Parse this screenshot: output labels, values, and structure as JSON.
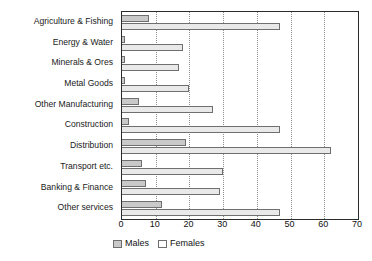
{
  "chart_data": {
    "type": "bar",
    "orientation": "horizontal",
    "title": "",
    "xlabel": "",
    "ylabel": "",
    "xlim": [
      0,
      70
    ],
    "xticks": [
      0,
      10,
      20,
      30,
      40,
      50,
      60,
      70
    ],
    "grid": true,
    "grid_axis": "x",
    "legend_position": "bottom",
    "categories": [
      "Agriculture & Fishing",
      "Energy & Water",
      "Minerals & Ores",
      "Metal Goods",
      "Other Manufacturing",
      "Construction",
      "Distribution",
      "Transport etc.",
      "Banking & Finance",
      "Other services"
    ],
    "series": [
      {
        "name": "Males",
        "color": "#c9c9c9",
        "values": [
          8,
          1,
          1,
          1,
          5,
          2,
          19,
          6,
          7,
          12
        ]
      },
      {
        "name": "Females",
        "color": "#e9e9e9",
        "values": [
          47,
          18,
          17,
          20,
          27,
          47,
          62,
          30,
          29,
          47
        ]
      }
    ]
  },
  "legend": {
    "entries": [
      {
        "label": "Males"
      },
      {
        "label": "Females"
      }
    ]
  }
}
